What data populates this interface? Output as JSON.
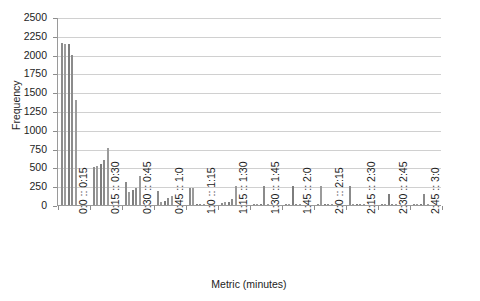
{
  "chart_data": {
    "type": "bar",
    "title": "",
    "subtitle": "",
    "xlabel": "Metric (minutes)",
    "ylabel": "Frequency",
    "ylim": [
      0,
      2500
    ],
    "yticks": [
      0,
      250,
      500,
      750,
      1000,
      1250,
      1500,
      1750,
      2000,
      2250,
      2500
    ],
    "ytick_labels": [
      "0",
      "250",
      "500",
      "750",
      "1000",
      "1250",
      "1500",
      "1750",
      "2000",
      "2250",
      "2500"
    ],
    "grid": "horizontal",
    "legend": "none",
    "categories": [
      "0:0 :: 0:15",
      "0:15 :: 0:30",
      "0:30 :: 0:45",
      "0:45 :: 1:0",
      "1:0 :: 1:15",
      "1:15 :: 1:30",
      "1:30 :: 1:45",
      "1:45 :: 2:0",
      "2:0 :: 2:15",
      "2:15 :: 2:30",
      "2:30 :: 2:45",
      "2:45 :: 3:0"
    ],
    "bars_per_category": 5,
    "values": [
      [
        2150,
        2140,
        2140,
        2000,
        1390
      ],
      [
        500,
        520,
        545,
        600,
        755
      ],
      [
        300,
        170,
        200,
        230,
        390
      ],
      [
        190,
        40,
        55,
        90,
        120
      ],
      [
        225,
        230,
        15,
        10,
        20
      ],
      [
        30,
        35,
        45,
        75,
        250
      ],
      [
        10,
        8,
        6,
        250,
        5
      ],
      [
        4,
        4,
        250,
        3,
        3
      ],
      [
        3,
        250,
        2,
        2,
        2
      ],
      [
        250,
        2,
        2,
        2,
        2
      ],
      [
        2,
        2,
        150,
        2,
        2
      ],
      [
        2,
        2,
        2,
        140,
        2
      ]
    ],
    "colors": {
      "bar": "#8b8b8b",
      "bar_alt": "#9b9b9b",
      "bar_dark": "#7d7d7d",
      "grid": "#d0d0d0",
      "axis": "#9a9a9a",
      "text": "#1d1d1d",
      "background": "#ffffff"
    }
  }
}
